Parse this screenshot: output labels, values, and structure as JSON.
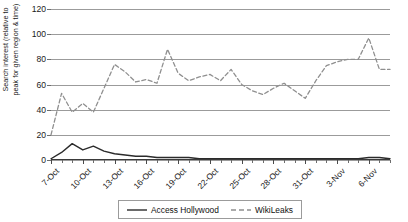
{
  "chart_data": {
    "type": "line",
    "title": "",
    "xlabel": "",
    "ylabel": "Search interest (relative to\npeak for given region & time)",
    "ylim": [
      0,
      120
    ],
    "yticks": [
      0,
      20,
      40,
      60,
      80,
      100,
      120
    ],
    "grid": true,
    "legend_position": "bottom",
    "x": [
      "7-Oct",
      "8-Oct",
      "9-Oct",
      "10-Oct",
      "11-Oct",
      "12-Oct",
      "13-Oct",
      "14-Oct",
      "15-Oct",
      "16-Oct",
      "17-Oct",
      "18-Oct",
      "19-Oct",
      "20-Oct",
      "21-Oct",
      "22-Oct",
      "23-Oct",
      "24-Oct",
      "25-Oct",
      "26-Oct",
      "27-Oct",
      "28-Oct",
      "29-Oct",
      "30-Oct",
      "31-Oct",
      "1-Nov",
      "2-Nov",
      "3-Nov",
      "4-Nov",
      "5-Nov",
      "6-Nov",
      "7-Nov",
      "8-Nov"
    ],
    "xtick_labels": [
      "7-Oct",
      "10-Oct",
      "13-Oct",
      "16-Oct",
      "19-Oct",
      "22-Oct",
      "25-Oct",
      "28-Oct",
      "31-Oct",
      "3-Nov",
      "6-Nov"
    ],
    "series": [
      {
        "name": "Access Hollywood",
        "style": "solid",
        "color": "#2b2b2b",
        "values": [
          1,
          6,
          13,
          8,
          11,
          7,
          5,
          4,
          3,
          3,
          2,
          2,
          2,
          2,
          1,
          1,
          1,
          1,
          1,
          1,
          1,
          1,
          1,
          1,
          1,
          1,
          1,
          1,
          1,
          1,
          2,
          2,
          1
        ]
      },
      {
        "name": "WikiLeaks",
        "style": "dashed",
        "color": "#8f8f8f",
        "values": [
          20,
          53,
          38,
          45,
          38,
          57,
          76,
          70,
          62,
          64,
          61,
          88,
          69,
          63,
          66,
          68,
          63,
          72,
          60,
          55,
          52,
          57,
          61,
          55,
          49,
          63,
          75,
          78,
          80,
          80,
          97,
          72,
          72
        ]
      }
    ]
  },
  "legend": {
    "items": [
      {
        "label": "Access Hollywood",
        "style": "solid"
      },
      {
        "label": "WikiLeaks",
        "style": "dashed"
      }
    ]
  }
}
